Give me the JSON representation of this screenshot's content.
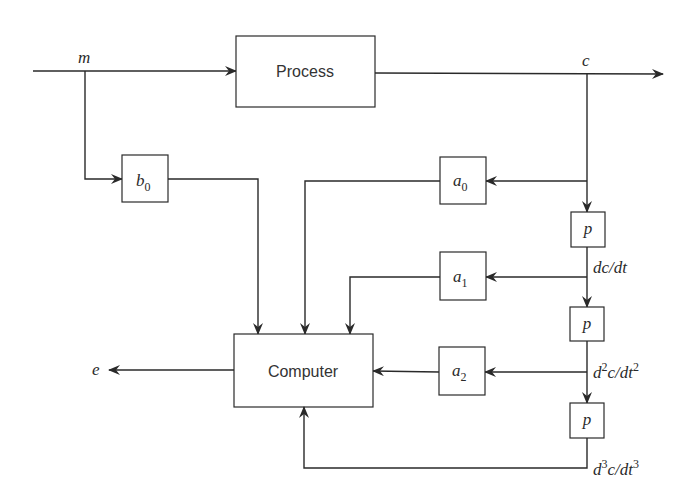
{
  "diagram": {
    "signals": {
      "input": "m",
      "output": "c",
      "computer_output": "e",
      "first_derivative": {
        "d": "dc/dt"
      },
      "second_derivative": {
        "d1": "d",
        "sup1": "2",
        "mid": "c/dt",
        "sup2": "2"
      },
      "third_derivative": {
        "d1": "d",
        "sup1": "3",
        "mid": "c/dt",
        "sup2": "3"
      }
    },
    "blocks": {
      "process": {
        "label": "Process"
      },
      "computer": {
        "label": "Computer"
      },
      "b0": {
        "base": "b",
        "sub": "0"
      },
      "a0": {
        "base": "a",
        "sub": "0"
      },
      "a1": {
        "base": "a",
        "sub": "1"
      },
      "a2": {
        "base": "a",
        "sub": "2"
      },
      "p1": {
        "label": "p"
      },
      "p2": {
        "label": "p"
      },
      "p3": {
        "label": "p"
      }
    },
    "colors": {
      "stroke": "#2a2a2a",
      "background": "#ffffff",
      "text": "#333333"
    }
  }
}
